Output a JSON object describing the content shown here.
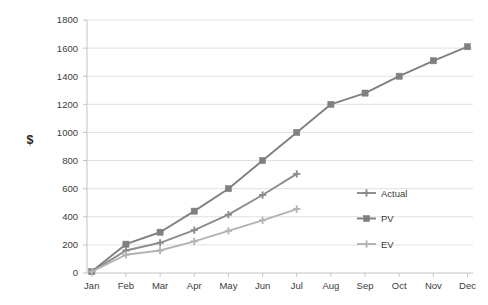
{
  "chart_data": {
    "type": "line",
    "title": "",
    "xlabel": "",
    "ylabel": "$",
    "ylim": [
      0,
      1800
    ],
    "ytick_step": 200,
    "yticks": [
      "0",
      "200",
      "400",
      "600",
      "800",
      "1000",
      "1200",
      "1400",
      "1600",
      "1800"
    ],
    "grid": true,
    "legend_position": "right-inside",
    "categories": [
      "Jan",
      "Feb",
      "Mar",
      "Apr",
      "May",
      "Jun",
      "Jul",
      "Aug",
      "Sep",
      "Oct",
      "Nov",
      "Dec"
    ],
    "series": [
      {
        "name": "Actual",
        "color": "#8c8c8c",
        "marker": "plus",
        "values": [
          10,
          160,
          215,
          305,
          415,
          555,
          705,
          null,
          null,
          null,
          null,
          null
        ]
      },
      {
        "name": "PV",
        "color": "#808080",
        "marker": "square",
        "values": [
          10,
          205,
          290,
          440,
          600,
          800,
          1000,
          1200,
          1280,
          1400,
          1510,
          1610
        ]
      },
      {
        "name": "EV",
        "color": "#b3b3b3",
        "marker": "plus",
        "values": [
          10,
          130,
          160,
          225,
          300,
          375,
          455,
          null,
          null,
          null,
          null,
          null
        ]
      }
    ]
  },
  "legend": {
    "items": [
      {
        "label": "Actual"
      },
      {
        "label": "PV"
      },
      {
        "label": "EV"
      }
    ]
  },
  "axes": {
    "y_title": "$"
  }
}
